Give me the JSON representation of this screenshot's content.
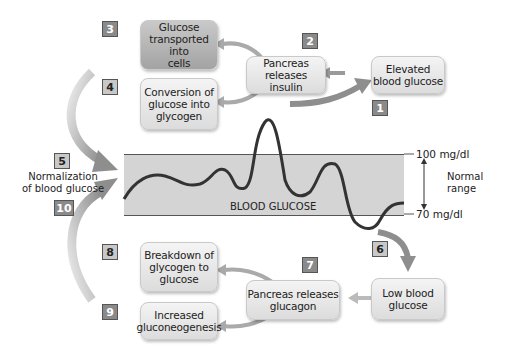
{
  "diagram": {
    "steps": [
      {
        "number": "1",
        "label": "Elevated blood glucose"
      },
      {
        "number": "2",
        "label": "Pancreas releases insulin"
      },
      {
        "number": "3",
        "label": "Glucose transported into cells"
      },
      {
        "number": "4",
        "label": "Conversion of glucose into glycogen"
      },
      {
        "number": "5",
        "label": "Normalization of blood glucose"
      },
      {
        "number": "6",
        "label": "Low blood glucose"
      },
      {
        "number": "7",
        "label": "Pancreas releases glucagon"
      },
      {
        "number": "8",
        "label": "Breakdown of glycogen to glucose"
      },
      {
        "number": "9",
        "label": "Increased gluconeogenesis"
      },
      {
        "number": "10",
        "label": "Normalization of blood glucose"
      }
    ],
    "boxes": {
      "glucose_transported_l1": "Glucose",
      "glucose_transported_l2": "transported into",
      "glucose_transported_l3": "cells",
      "conversion_l1": "Conversion of",
      "conversion_l2": "glucose into",
      "conversion_l3": "glycogen",
      "pancreas_insulin_l1": "Pancreas",
      "pancreas_insulin_l2": "releases insulin",
      "elevated_l1": "Elevated",
      "elevated_l2": "blood glucose",
      "breakdown_l1": "Breakdown of",
      "breakdown_l2": "glycogen to",
      "breakdown_l3": "glucose",
      "increased_l1": "Increased",
      "increased_l2": "gluconeogenesis",
      "pancreas_glucagon_l1": "Pancreas releases",
      "pancreas_glucagon_l2": "glucagon",
      "low_l1": "Low blood",
      "low_l2": "glucose"
    },
    "normalization_l1": "Normalization",
    "normalization_l2": "of blood glucose",
    "chart": {
      "label": "BLOOD GLUCOSE",
      "upper": "100 mg/dl",
      "lower": "70 mg/dl",
      "range_l1": "Normal",
      "range_l2": "range"
    },
    "colors": {
      "dark_box": "#b0b0b0",
      "light_box": "#e6e6e6",
      "band": "#d4d4d4",
      "arrow": "#9a9a9a"
    }
  }
}
